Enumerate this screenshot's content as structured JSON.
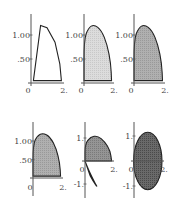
{
  "chart_data": [
    {
      "type": "area",
      "panel": "top-left",
      "title": "",
      "xlabel": "",
      "ylabel": "",
      "xlim": [
        0,
        2
      ],
      "ylim": [
        0,
        1.25
      ],
      "x_ticks": [
        "0",
        "2."
      ],
      "y_ticks": [
        "1.00",
        ".50"
      ],
      "y_tick_values": [
        1.0,
        0.5
      ],
      "fill": "none",
      "shape": "wedge",
      "points": [
        [
          0.15,
          0.05
        ],
        [
          0.6,
          1.2
        ],
        [
          1.0,
          1.15
        ],
        [
          1.5,
          0.85
        ],
        [
          1.8,
          0.4
        ],
        [
          1.9,
          0.05
        ]
      ]
    },
    {
      "type": "area",
      "panel": "top-middle",
      "xlim": [
        0,
        2
      ],
      "ylim": [
        0,
        1.25
      ],
      "x_ticks": [
        "0",
        "2."
      ],
      "y_ticks": [
        "1.00",
        ".50"
      ],
      "y_tick_values": [
        1.0,
        0.5
      ],
      "fill": "light",
      "shape": "half-lobe",
      "points": [
        [
          0.0,
          0.05
        ],
        [
          0.0,
          0.9
        ],
        [
          0.3,
          1.15
        ],
        [
          0.7,
          1.22
        ],
        [
          1.2,
          1.1
        ],
        [
          1.6,
          0.8
        ],
        [
          1.85,
          0.4
        ],
        [
          1.9,
          0.05
        ]
      ]
    },
    {
      "type": "area",
      "panel": "top-right",
      "xlim": [
        0,
        2
      ],
      "ylim": [
        0,
        1.25
      ],
      "x_ticks": [
        "0",
        "2."
      ],
      "y_ticks": [
        "1.00",
        ".50"
      ],
      "y_tick_values": [
        1.0,
        0.5
      ],
      "fill": "medium",
      "shape": "half-lobe",
      "points": [
        [
          0.0,
          0.05
        ],
        [
          0.0,
          0.9
        ],
        [
          0.3,
          1.15
        ],
        [
          0.7,
          1.22
        ],
        [
          1.2,
          1.1
        ],
        [
          1.6,
          0.8
        ],
        [
          1.85,
          0.4
        ],
        [
          1.9,
          0.05
        ]
      ]
    },
    {
      "type": "area",
      "panel": "bottom-left",
      "xlim": [
        0,
        2
      ],
      "ylim": [
        0,
        1.25
      ],
      "x_ticks": [
        "0",
        "2."
      ],
      "y_ticks": [
        "1.00",
        ".50"
      ],
      "y_tick_values": [
        1.0,
        0.5
      ],
      "fill": "medium",
      "shape": "half-lobe",
      "points": [
        [
          0.0,
          0.05
        ],
        [
          0.0,
          0.9
        ],
        [
          0.3,
          1.15
        ],
        [
          0.7,
          1.22
        ],
        [
          1.2,
          1.1
        ],
        [
          1.6,
          0.8
        ],
        [
          1.85,
          0.4
        ],
        [
          1.9,
          0.05
        ]
      ]
    },
    {
      "type": "area",
      "panel": "bottom-middle",
      "xlim": [
        0,
        2
      ],
      "ylim": [
        -1.2,
        1.2
      ],
      "x_ticks": [
        "0",
        "2."
      ],
      "y_ticks": [
        "1.",
        "-1."
      ],
      "y_tick_values": [
        1.0,
        -1.0
      ],
      "fill": "dark",
      "shape": "upper-lobe-plus-lower-petal",
      "points": [
        [
          0.0,
          0.0
        ],
        [
          0.0,
          0.75
        ],
        [
          0.4,
          1.05
        ],
        [
          0.9,
          1.1
        ],
        [
          1.4,
          0.85
        ],
        [
          1.8,
          0.45
        ],
        [
          1.9,
          0.0
        ]
      ],
      "lower_points": [
        [
          0.0,
          0.0
        ],
        [
          0.3,
          -0.45
        ],
        [
          0.7,
          -0.95
        ],
        [
          0.9,
          -1.15
        ],
        [
          0.6,
          -0.9
        ],
        [
          0.15,
          -0.4
        ]
      ]
    },
    {
      "type": "area",
      "panel": "bottom-right",
      "xlim": [
        0,
        2
      ],
      "ylim": [
        -1.2,
        1.2
      ],
      "x_ticks": [
        "0",
        "2."
      ],
      "y_ticks": [
        "1.",
        "-1."
      ],
      "y_tick_values": [
        1.0,
        -1.0
      ],
      "fill": "darkest",
      "shape": "full-ellipse",
      "center": [
        0.95,
        0.0
      ],
      "radii": [
        0.98,
        1.15
      ]
    }
  ],
  "colors": {
    "light": "#d4d4d4",
    "medium": "#a8a8a8",
    "dark": "#8c8c8c",
    "darkest": "#5e5e5e",
    "outline": "#222222",
    "axis": "#555555",
    "text": "#444444"
  }
}
